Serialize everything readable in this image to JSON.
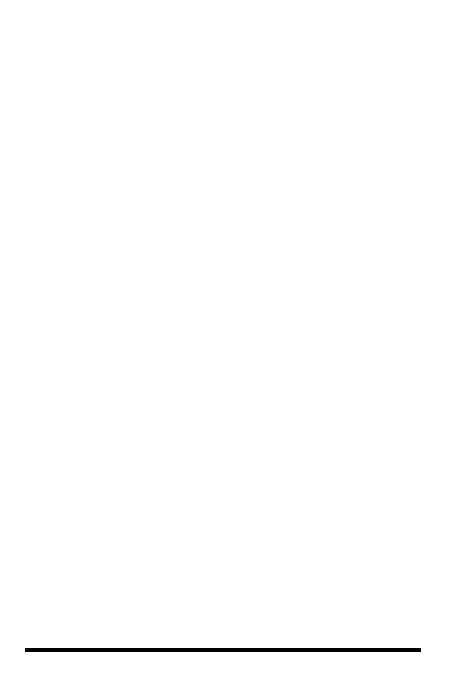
{
  "chart_data": {
    "type": "bar",
    "orientation": "horizontal-printed-rotated",
    "title": "",
    "xlabel": "",
    "ylabel": "MEDIAN INCOME",
    "value_axis_title": "MEDIAN INCOME",
    "tick_labels": [
      "$4,000",
      "3,000",
      "2,000",
      "1,000"
    ],
    "tick_values": [
      4000,
      3000,
      2000,
      1000
    ],
    "ylim": [
      0,
      4200
    ],
    "grid": false,
    "legend_position": "inline-bar-labels",
    "categories": [
      "65-69",
      "70-74",
      "75-79",
      "80 AND OVER"
    ],
    "groups": [
      {
        "name": "MARRIED COUPLES",
        "count": "6.0 MILLION",
        "bars": [
          {
            "category": "65-69",
            "value": 4070,
            "fill": "#ffffff"
          },
          {
            "category": "70-74",
            "value": 3560,
            "fill": "#d4d4d4"
          },
          {
            "category": "75-79",
            "value": 2830,
            "fill": "#8a8a8a"
          },
          {
            "category": "80 AND OVER",
            "value": 2370,
            "fill": "#595959"
          }
        ]
      },
      {
        "name": "NONMARRIED MEN",
        "count": "2.3 MILLION",
        "bars": [
          {
            "category": "65-69",
            "value": 1620,
            "fill": "#ffffff"
          },
          {
            "category": "70-74",
            "value": 1890,
            "fill": "#d4d4d4"
          },
          {
            "category": "75-79",
            "value": 1620,
            "fill": "#8a8a8a"
          },
          {
            "category": "80 AND OVER",
            "value": 1250,
            "fill": "#595959"
          }
        ]
      },
      {
        "name": "NONMARRIED WOMEN",
        "count": "7.4 MILLION",
        "bars": [
          {
            "category": "65-69",
            "value": 1470,
            "fill": "#ffffff"
          },
          {
            "category": "70-74",
            "value": 1390,
            "fill": "#d4d4d4"
          },
          {
            "category": "75-79",
            "value": 1175,
            "fill": "#8a8a8a"
          },
          {
            "category": "80 AND OVER",
            "value": 1030,
            "fill": "#595959"
          }
        ]
      }
    ],
    "colors": {
      "age_65_69": "#ffffff",
      "age_70_74": "#d4d4d4",
      "age_75_79": "#8a8a8a",
      "age_80_over": "#595959",
      "outline": "#000000",
      "background": "#ffffff"
    }
  },
  "axis": {
    "title": "MEDIAN INCOME",
    "ticks": [
      {
        "label": "$4,000",
        "value": 4000
      },
      {
        "label": "3,000",
        "value": 3000
      },
      {
        "label": "2,000",
        "value": 2000
      },
      {
        "label": "1,000",
        "value": 1000
      }
    ]
  },
  "bar_labels": {
    "a": "65-69",
    "b": "70-74",
    "c": "75-79",
    "d_line1": "80 AND",
    "d_line2": "OVER"
  },
  "groups": {
    "married": {
      "count": "6.0 MILLION",
      "name": "MARRIED COUPLES"
    },
    "men": {
      "count": "2.3 MILLION",
      "name": "NONMARRIED MEN"
    },
    "women": {
      "count": "7.4 MILLION",
      "name": "NONMARRIED WOMEN"
    }
  }
}
